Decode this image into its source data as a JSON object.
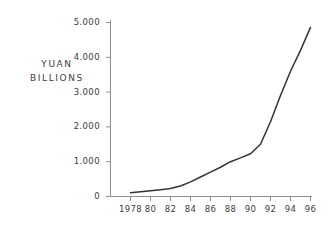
{
  "chart_data": {
    "type": "line",
    "title": "",
    "subtitle": "",
    "xlabel": "",
    "ylabel": "YUAN BILLIONS",
    "ylabel_lines": [
      "YUAN",
      "BILLIONS"
    ],
    "x": [
      1978,
      1979,
      1980,
      1981,
      1982,
      1983,
      1984,
      1985,
      1986,
      1987,
      1988,
      1989,
      1990,
      1991,
      1992,
      1993,
      1994,
      1995,
      1996
    ],
    "values": [
      110,
      140,
      165,
      195,
      230,
      300,
      420,
      560,
      700,
      840,
      1000,
      1110,
      1230,
      1500,
      2150,
      2900,
      3600,
      4200,
      4860
    ],
    "series": [
      {
        "name": "Yuan (billions)",
        "values": [
          110,
          140,
          165,
          195,
          230,
          300,
          420,
          560,
          700,
          840,
          1000,
          1110,
          1230,
          1500,
          2150,
          2900,
          3600,
          4200,
          4860
        ]
      }
    ],
    "xlim": [
      1978,
      1997
    ],
    "ylim": [
      0,
      5000
    ],
    "xtick_labels": [
      "1978",
      "80",
      "82",
      "84",
      "86",
      "88",
      "90",
      "92",
      "94",
      "96"
    ],
    "xtick_values": [
      1978,
      1980,
      1982,
      1984,
      1986,
      1988,
      1990,
      1992,
      1994,
      1996
    ],
    "ytick_labels": [
      "0",
      "1.000",
      "2.000",
      "3.000",
      "4.000",
      "5.000"
    ],
    "ytick_values": [
      0,
      1000,
      2000,
      3000,
      4000,
      5000
    ],
    "grid": false,
    "legend": "none",
    "line_color": "#333333",
    "axis_color": "#8a8a8a",
    "background_color": "#ffffff",
    "text_color": "#3d3d3d"
  },
  "ytick_labels": {
    "t0": "0",
    "t1": "1.000",
    "t2": "2.000",
    "t3": "3.000",
    "t4": "4.000",
    "t5": "5.000"
  },
  "xtick_labels": {
    "t0": "1978",
    "t1": "80",
    "t2": "82",
    "t3": "84",
    "t4": "86",
    "t5": "88",
    "t6": "90",
    "t7": "92",
    "t8": "94",
    "t9": "96"
  },
  "axis_title": {
    "line1": "YUAN",
    "line2": "BILLIONS"
  }
}
